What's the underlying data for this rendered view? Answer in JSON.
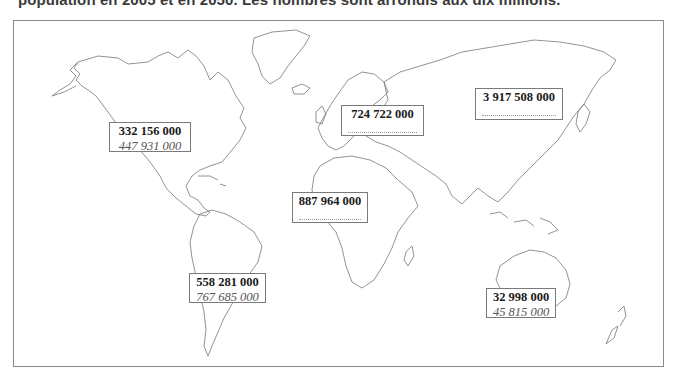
{
  "caption": "population en 2005 et en 2050. Les nombres sont arrondis aux dix millions.",
  "map": {
    "title": "World map worksheet",
    "regions": [
      {
        "id": "north-america",
        "name": "Amérique du Nord",
        "pop_2005": "332 156 000",
        "pop_2050": "447 931 000",
        "blank": false
      },
      {
        "id": "europe",
        "name": "Europe",
        "pop_2005": "724 722 000",
        "pop_2050": "",
        "blank": true
      },
      {
        "id": "asia",
        "name": "Asie",
        "pop_2005": "3 917 508 000",
        "pop_2050": "",
        "blank": true
      },
      {
        "id": "africa",
        "name": "Afrique",
        "pop_2005": "887 964 000",
        "pop_2050": "",
        "blank": true
      },
      {
        "id": "south-america",
        "name": "Amérique du Sud",
        "pop_2005": "558 281 000",
        "pop_2050": "767 685 000",
        "blank": false
      },
      {
        "id": "oceania",
        "name": "Océanie",
        "pop_2005": "32 998 000",
        "pop_2050": "45 815 000",
        "blank": false
      }
    ]
  },
  "colors": {
    "outline": "#8a8a8a",
    "coast": "#777777",
    "box_border": "#7a7a7a",
    "value_bold": "#1a1a1a",
    "value_italic": "#555555"
  }
}
